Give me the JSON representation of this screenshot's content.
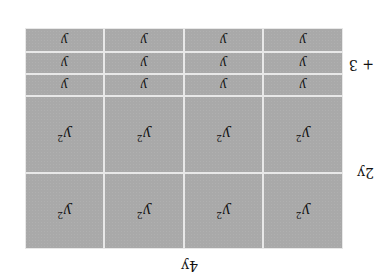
{
  "diagram": {
    "orientation": "rotated 180 degrees",
    "dimensions": {
      "width_label": "4y",
      "height_labels": [
        "2y",
        "+ 3"
      ]
    },
    "tile_colors": {
      "tile": "#a9a9a9",
      "gap": "#e8e8e8"
    },
    "rows": [
      {
        "type": "y2",
        "label": "y",
        "exponent": "2",
        "count": 4
      },
      {
        "type": "y2",
        "label": "y",
        "exponent": "2",
        "count": 4
      },
      {
        "type": "y",
        "label": "y",
        "count": 4
      },
      {
        "type": "y",
        "label": "y",
        "count": 4
      },
      {
        "type": "y",
        "label": "y",
        "count": 4
      }
    ],
    "expression": "(2y + 3)(4y) = 8y^2 + 12y"
  }
}
